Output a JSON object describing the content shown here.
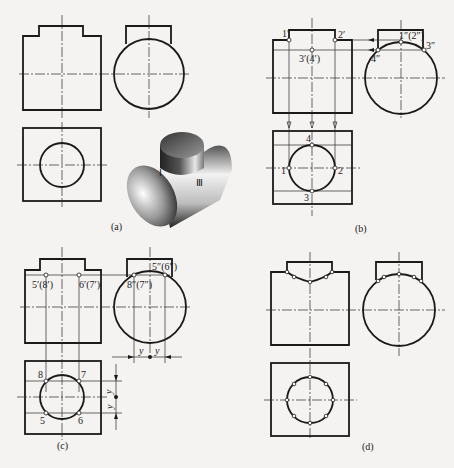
{
  "figure": {
    "panels": [
      {
        "id": "a",
        "caption": "(a)",
        "roman_labels": [
          "Ⅰ",
          "Ⅲ"
        ]
      },
      {
        "id": "b",
        "caption": "(b)",
        "labels": {
          "p1_front": "1′",
          "p2_front": "2′",
          "p34_front": "3′(4′)",
          "p12_side": "1″(2″)",
          "p3_side": "3″",
          "p4_side": "4″",
          "p1_top": "1",
          "p2_top": "2",
          "p3_top": "3",
          "p4_top": "4"
        }
      },
      {
        "id": "c",
        "caption": "(c)",
        "labels": {
          "p58_front": "5′(8′)",
          "p67_front": "6′(7′)",
          "p56_side": "5″(6″)",
          "p87_side": "8″(7″)",
          "p5_top": "5",
          "p6_top": "6",
          "p7_top": "7",
          "p8_top": "8",
          "dim_y": "y"
        }
      },
      {
        "id": "d",
        "caption": "(d)"
      }
    ],
    "colors": {
      "line": "#1a1a1a",
      "background": "#f4f3f1"
    }
  }
}
